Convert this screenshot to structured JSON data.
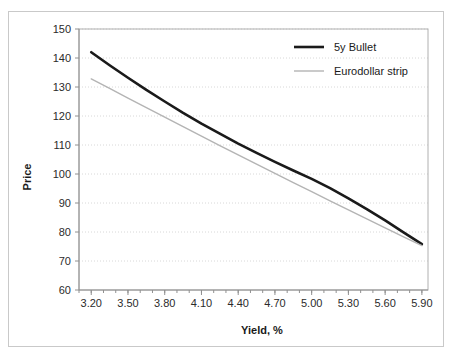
{
  "chart_data": {
    "type": "line",
    "title": "",
    "xlabel": "Yield, %",
    "ylabel": "Price",
    "xlim": [
      3.1,
      5.95
    ],
    "ylim": [
      60,
      150
    ],
    "grid": "horizontal-dotted",
    "legend_position": "top-right",
    "y_ticks": [
      60,
      70,
      80,
      90,
      100,
      110,
      120,
      130,
      140,
      150
    ],
    "y_tick_labels": [
      "60",
      "70",
      "80",
      "90",
      "100",
      "110",
      "120",
      "130",
      "140",
      "150"
    ],
    "x_ticks": [
      3.2,
      3.5,
      3.8,
      4.1,
      4.4,
      4.7,
      5.0,
      5.3,
      5.6,
      5.9
    ],
    "x_tick_labels": [
      "3.20",
      "3.50",
      "3.80",
      "4.10",
      "4.40",
      "4.70",
      "5.00",
      "5.30",
      "5.60",
      "5.90"
    ],
    "x_minor_step": 0.1,
    "series": [
      {
        "name": "5y Bullet",
        "color": "#1a1a1a",
        "width": 2.6,
        "x": [
          3.2,
          3.35,
          3.5,
          3.65,
          3.8,
          3.95,
          4.1,
          4.25,
          4.4,
          4.55,
          4.7,
          4.85,
          5.0,
          5.15,
          5.3,
          5.45,
          5.6,
          5.75,
          5.9
        ],
        "values": [
          142.0,
          137.5,
          133.2,
          129.0,
          125.0,
          121.1,
          117.4,
          113.9,
          110.5,
          107.3,
          104.2,
          101.2,
          98.3,
          95.1,
          91.6,
          87.9,
          84.0,
          79.9,
          75.8
        ]
      },
      {
        "name": "Eurodollar strip",
        "color": "#b4b4b4",
        "width": 1.4,
        "x": [
          3.2,
          3.35,
          3.5,
          3.65,
          3.8,
          3.95,
          4.1,
          4.25,
          4.4,
          4.55,
          4.7,
          4.85,
          5.0,
          5.15,
          5.3,
          5.45,
          5.6,
          5.75,
          5.9
        ],
        "values": [
          132.8,
          129.5,
          126.2,
          122.9,
          119.6,
          116.3,
          113.1,
          109.8,
          106.6,
          103.4,
          100.2,
          97.0,
          93.9,
          90.7,
          87.6,
          84.5,
          81.4,
          78.3,
          75.3
        ]
      }
    ],
    "legend_entries": [
      {
        "label": "5y Bullet",
        "color": "#1a1a1a",
        "width": 2.6
      },
      {
        "label": "Eurodollar strip",
        "color": "#b4b4b4",
        "width": 1.4
      }
    ]
  }
}
